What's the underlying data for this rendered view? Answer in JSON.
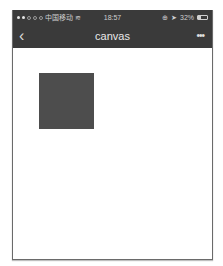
{
  "status_bar": {
    "signal_dots": [
      true,
      true,
      false,
      false,
      false
    ],
    "carrier": "中国移动",
    "wifi_icon": "wifi-icon",
    "time": "18:57",
    "location_icon": "location-icon",
    "lock_icon": "orientation-lock-icon",
    "battery_percent": "32%",
    "battery_icon": "battery-icon"
  },
  "nav_bar": {
    "back_glyph": "‹",
    "title": "canvas",
    "more_glyph": "•••"
  },
  "canvas": {
    "shape": "rectangle",
    "fill_color": "#4d4d4d"
  },
  "colors": {
    "header_bg": "#3a3a3a",
    "content_bg": "#ffffff"
  }
}
